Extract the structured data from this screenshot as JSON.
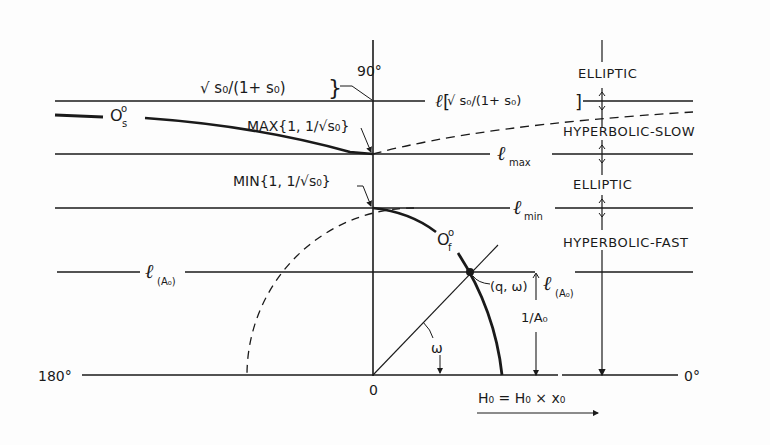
{
  "figure": {
    "axes": {
      "angle_90": "90°",
      "angle_180": "180°",
      "angle_0": "0°",
      "origin": "0"
    },
    "regions": [
      {
        "id": "elliptic-top",
        "label": "ELLIPTIC"
      },
      {
        "id": "hyperbolic-slow",
        "label": "HYPERBOLIC-SLOW"
      },
      {
        "id": "elliptic-mid",
        "label": "ELLIPTIC"
      },
      {
        "id": "hyperbolic-fast",
        "label": "HYPERBOLIC-FAST"
      }
    ],
    "levels": {
      "l_sqrt_prefix": "ℓ",
      "l_sqrt_expr": "√ s₀/(1+ s₀)",
      "l_max": "ℓ",
      "l_max_sub": "max",
      "l_min": "ℓ",
      "l_min_sub": "min",
      "l_A0_left": "ℓ",
      "l_A0_left_sub": "(A₀)",
      "l_A0_right": "ℓ",
      "l_A0_right_sub": "(A₀)"
    },
    "annotations": {
      "sqrt_top": "√ s₀/(1+ s₀)",
      "max_expr": "MAX{1, 1/√s₀}",
      "min_expr": "MIN{1, 1/√s₀}",
      "orbit_slow": "O",
      "orbit_slow_sup": "o",
      "orbit_slow_sub": "s",
      "orbit_fast": "O",
      "orbit_fast_sup": "o",
      "orbit_fast_sub": "f",
      "point": "(q, ω)",
      "omega": "ω",
      "inv_A0": "1/A₀",
      "h_vector": "H₀ = H₀ × x₀"
    }
  }
}
